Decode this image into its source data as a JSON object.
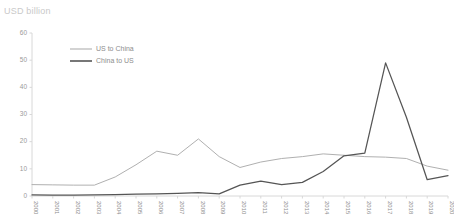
{
  "chart_data": {
    "type": "line",
    "title": "USD billion",
    "xlabel": "",
    "ylabel": "USD billion",
    "ylim": [
      0,
      60
    ],
    "yticks": [
      0,
      10,
      20,
      30,
      40,
      50,
      60
    ],
    "grid": false,
    "legend_position": "top-left-inside",
    "categories": [
      "2000",
      "2001",
      "2002",
      "2003",
      "2004",
      "2005",
      "2006",
      "2007",
      "2008",
      "2009",
      "2010",
      "2011",
      "2012",
      "2013",
      "2014",
      "2015",
      "2016",
      "2017",
      "2018",
      "2019",
      "2020"
    ],
    "series": [
      {
        "name": "US to China",
        "color": "#b0b0b0",
        "values": [
          4.2,
          4.1,
          4.0,
          4.0,
          7.0,
          11.5,
          16.5,
          15.0,
          21.0,
          14.5,
          10.5,
          12.5,
          13.8,
          14.5,
          15.5,
          15.0,
          14.5,
          14.3,
          13.8,
          11.0,
          9.5
        ]
      },
      {
        "name": "China to US",
        "color": "#555555",
        "values": [
          0.4,
          0.3,
          0.3,
          0.4,
          0.5,
          0.7,
          0.8,
          1.0,
          1.2,
          0.8,
          4.0,
          5.5,
          4.2,
          5.0,
          9.0,
          14.8,
          15.8,
          49.0,
          29.0,
          6.0,
          7.5
        ]
      }
    ]
  },
  "legend": {
    "items": [
      {
        "label": "US to China",
        "color": "#b0b0b0"
      },
      {
        "label": "China to US",
        "color": "#555555"
      }
    ]
  }
}
